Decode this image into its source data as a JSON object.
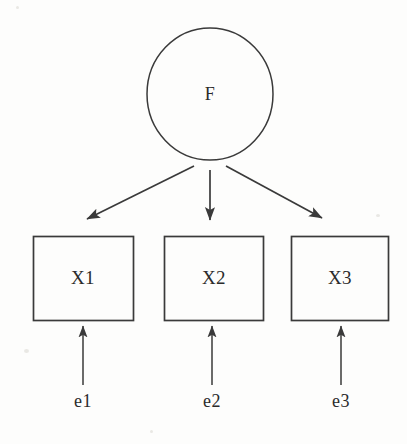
{
  "figure": {
    "type": "path-diagram",
    "background_color": "#fdfdfc",
    "stroke_color": "#3a3a3a",
    "text_color": "#2b2b2b"
  },
  "nodes": {
    "latent": {
      "id": "F",
      "label": "F",
      "shape": "ellipse",
      "cx": 210,
      "cy": 94,
      "rx": 63,
      "ry": 66
    },
    "indicators": [
      {
        "id": "X1",
        "label": "X1",
        "shape": "rect",
        "x": 33,
        "y": 236,
        "width": 100,
        "height": 84
      },
      {
        "id": "X2",
        "label": "X2",
        "shape": "rect",
        "x": 164,
        "y": 236,
        "width": 99,
        "height": 84
      },
      {
        "id": "X3",
        "label": "X3",
        "shape": "rect",
        "x": 291,
        "y": 236,
        "width": 97,
        "height": 84
      }
    ],
    "errors": [
      {
        "id": "e1",
        "label": "e1",
        "x": 83,
        "y": 401
      },
      {
        "id": "e2",
        "label": "e2",
        "x": 212,
        "y": 401
      },
      {
        "id": "e3",
        "label": "e3",
        "x": 341,
        "y": 401
      }
    ]
  },
  "edges": [
    {
      "id": "F-X1",
      "from": "F",
      "to": "X1",
      "style": "single-headed-arrow"
    },
    {
      "id": "F-X2",
      "from": "F",
      "to": "X2",
      "style": "single-headed-arrow"
    },
    {
      "id": "F-X3",
      "from": "F",
      "to": "X3",
      "style": "single-headed-arrow"
    },
    {
      "id": "e1-X1",
      "from": "e1",
      "to": "X1",
      "style": "single-headed-arrow"
    },
    {
      "id": "e2-X2",
      "from": "e2",
      "to": "X2",
      "style": "single-headed-arrow"
    },
    {
      "id": "e3-X3",
      "from": "e3",
      "to": "X3",
      "style": "single-headed-arrow"
    }
  ]
}
